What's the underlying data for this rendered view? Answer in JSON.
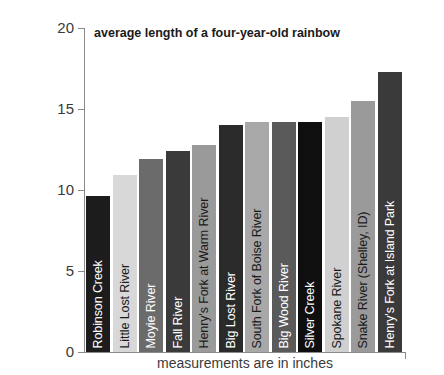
{
  "chart_data": {
    "type": "bar",
    "title": "average length of a four-year-old rainbow",
    "xlabel": "measurements are in inches",
    "ylabel": "",
    "ylim": [
      0,
      20
    ],
    "yticks": [
      0,
      5,
      10,
      15,
      20
    ],
    "grid": false,
    "legend": false,
    "categories": [
      "Robinson Creek",
      "Little Lost River",
      "Moyie River",
      "Fall River",
      "Henry's Fork at Warm River",
      "Big Lost River",
      "South Fork of Boise River",
      "Big Wood River",
      "Silver Creek",
      "Spokane River",
      "Snake River (Shelley, ID)",
      "Henry's Fork at Island Park"
    ],
    "values": [
      9.6,
      10.9,
      11.9,
      12.4,
      12.8,
      14.0,
      14.2,
      14.2,
      14.2,
      14.5,
      15.5,
      17.3
    ],
    "bar_colors": [
      "#1c1c1c",
      "#d8d8d8",
      "#6b6b6b",
      "#3a3a3a",
      "#9a9a9a",
      "#2a2a2a",
      "#a8a8a8",
      "#5a5a5a",
      "#0f0f0f",
      "#d0d0d0",
      "#9a9a9a",
      "#3a3a3a"
    ],
    "label_tones": [
      "dark",
      "light",
      "dark",
      "dark",
      "light",
      "dark",
      "light",
      "dark",
      "dark",
      "light",
      "light",
      "dark"
    ]
  },
  "axis": {
    "tick_labels": [
      "20",
      "15",
      "10",
      "5",
      "0"
    ]
  }
}
